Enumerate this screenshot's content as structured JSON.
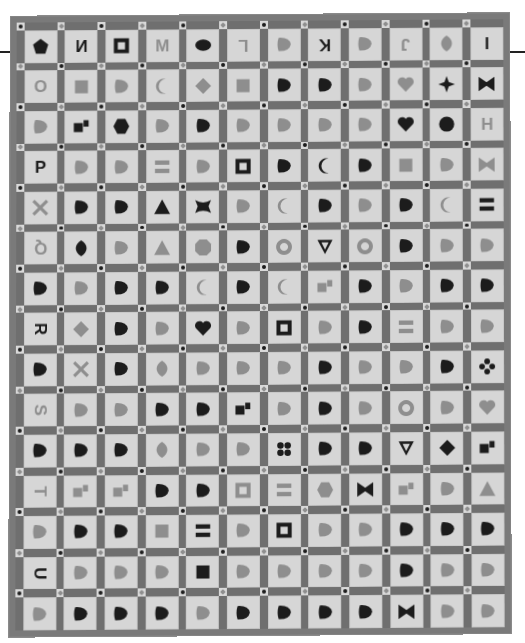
{
  "image": {
    "subject": "Appliqué alphabet sampler quilt",
    "grid": {
      "columns": 12,
      "rows": 15
    },
    "date_block": "1871",
    "palette": {
      "background": "#ffffff",
      "sashing": "#6f6f6f",
      "block": "#d6d6d6",
      "dark": "#1c1c1c",
      "mid": "#8e8e8e",
      "light_shape": "#a8a8a8"
    }
  },
  "rows": [
    [
      {
        "t": "shape",
        "s": "pentagon",
        "c": "dark"
      },
      {
        "t": "letter",
        "v": "N",
        "c": "dark",
        "f": "mirror"
      },
      {
        "t": "shape",
        "s": "square-frame",
        "c": "dark"
      },
      {
        "t": "letter",
        "v": "M",
        "c": "mid",
        "f": "mirror"
      },
      {
        "t": "shape",
        "s": "oval",
        "c": "dark"
      },
      {
        "t": "letter",
        "v": "L",
        "c": "mid",
        "f": "rot180"
      },
      {
        "t": "shape",
        "s": "star-cross",
        "c": "mid"
      },
      {
        "t": "letter",
        "v": "K",
        "c": "dark",
        "f": "rot180"
      },
      {
        "t": "shape",
        "s": "wing",
        "c": "mid"
      },
      {
        "t": "letter",
        "v": "J",
        "c": "mid",
        "f": "rot180"
      },
      {
        "t": "shape",
        "s": "leaf",
        "c": "mid"
      },
      {
        "t": "letter",
        "v": "I",
        "c": "dark"
      }
    ],
    [
      {
        "t": "letter",
        "v": "O",
        "c": "mid"
      },
      {
        "t": "shape",
        "s": "square",
        "c": "mid"
      },
      {
        "t": "shape",
        "s": "leaves",
        "c": "mid"
      },
      {
        "t": "shape",
        "s": "crescent",
        "c": "mid"
      },
      {
        "t": "shape",
        "s": "diamond",
        "c": "mid"
      },
      {
        "t": "shape",
        "s": "square",
        "c": "mid"
      },
      {
        "t": "shape",
        "s": "wedge",
        "c": "dark"
      },
      {
        "t": "shape",
        "s": "z-block",
        "c": "dark"
      },
      {
        "t": "shape",
        "s": "basket",
        "c": "mid"
      },
      {
        "t": "shape",
        "s": "heart",
        "c": "mid"
      },
      {
        "t": "shape",
        "s": "four-point-star",
        "c": "dark"
      },
      {
        "t": "shape",
        "s": "bowtie",
        "c": "dark"
      }
    ],
    [
      {
        "t": "shape",
        "s": "pinwheel",
        "c": "mid"
      },
      {
        "t": "shape",
        "s": "squares",
        "c": "dark"
      },
      {
        "t": "shape",
        "s": "hexagon",
        "c": "dark"
      },
      {
        "t": "shape",
        "s": "scissors",
        "c": "mid"
      },
      {
        "t": "shape",
        "s": "spool",
        "c": "dark"
      },
      {
        "t": "shape",
        "s": "bar",
        "c": "mid"
      },
      {
        "t": "shape",
        "s": "cross",
        "c": "mid"
      },
      {
        "t": "shape",
        "s": "fan",
        "c": "mid"
      },
      {
        "t": "shape",
        "s": "bowl",
        "c": "mid"
      },
      {
        "t": "shape",
        "s": "heart",
        "c": "dark"
      },
      {
        "t": "shape",
        "s": "circle-split",
        "c": "dark"
      },
      {
        "t": "letter",
        "v": "H",
        "c": "mid"
      }
    ],
    [
      {
        "t": "letter",
        "v": "P",
        "c": "dark"
      },
      {
        "t": "shape",
        "s": "arc",
        "c": "mid"
      },
      {
        "t": "shape",
        "s": "arc",
        "c": "mid"
      },
      {
        "t": "shape",
        "s": "bars",
        "c": "mid"
      },
      {
        "t": "shape",
        "s": "fan",
        "c": "mid"
      },
      {
        "t": "shape",
        "s": "square-frame",
        "c": "dark"
      },
      {
        "t": "shape",
        "s": "boot",
        "c": "dark"
      },
      {
        "t": "shape",
        "s": "crescent",
        "c": "dark"
      },
      {
        "t": "shape",
        "s": "domino",
        "c": "dark"
      },
      {
        "t": "shape",
        "s": "square",
        "c": "mid"
      },
      {
        "t": "shape",
        "s": "angle",
        "c": "mid"
      },
      {
        "t": "shape",
        "s": "bowtie",
        "c": "mid"
      }
    ],
    [
      {
        "t": "shape",
        "s": "x-cross",
        "c": "mid"
      },
      {
        "t": "shape",
        "s": "split-circle",
        "c": "dark"
      },
      {
        "t": "shape",
        "s": "patchwork",
        "c": "dark"
      },
      {
        "t": "shape",
        "s": "triangle",
        "c": "dark"
      },
      {
        "t": "shape",
        "s": "butterfly",
        "c": "dark"
      },
      {
        "t": "shape",
        "s": "half-circles",
        "c": "mid"
      },
      {
        "t": "shape",
        "s": "crescent",
        "c": "mid"
      },
      {
        "t": "shape",
        "s": "patchwork",
        "c": "dark"
      },
      {
        "t": "shape",
        "s": "leaf-pair",
        "c": "mid"
      },
      {
        "t": "shape",
        "s": "u-shape",
        "c": "dark"
      },
      {
        "t": "shape",
        "s": "crescent",
        "c": "mid"
      },
      {
        "t": "shape",
        "s": "bars",
        "c": "dark"
      }
    ],
    [
      {
        "t": "letter",
        "v": "Q",
        "c": "mid",
        "f": "rot180"
      },
      {
        "t": "shape",
        "s": "leaf",
        "c": "dark"
      },
      {
        "t": "shape",
        "s": "axe",
        "c": "mid"
      },
      {
        "t": "shape",
        "s": "triangle",
        "c": "mid"
      },
      {
        "t": "shape",
        "s": "octagon",
        "c": "mid"
      },
      {
        "t": "shape",
        "s": "leaves",
        "c": "dark"
      },
      {
        "t": "shape",
        "s": "ring",
        "c": "mid"
      },
      {
        "t": "shape",
        "s": "triangle-frame",
        "c": "dark"
      },
      {
        "t": "shape",
        "s": "ring",
        "c": "mid"
      },
      {
        "t": "shape",
        "s": "patchwork",
        "c": "dark"
      },
      {
        "t": "shape",
        "s": "flower",
        "c": "mid"
      },
      {
        "t": "shape",
        "s": "leaf-pair",
        "c": "mid"
      },
      {
        "t": "letter",
        "v": "F",
        "c": "dark",
        "f": "rot90"
      }
    ],
    [
      {
        "t": "shape",
        "s": "wedge-dot",
        "c": "dark"
      },
      {
        "t": "shape",
        "s": "leaves",
        "c": "mid"
      },
      {
        "t": "shape",
        "s": "horseshoe",
        "c": "dark"
      },
      {
        "t": "shape",
        "s": "trees",
        "c": "dark"
      },
      {
        "t": "shape",
        "s": "crescent",
        "c": "mid"
      },
      {
        "t": "shape",
        "s": "square-boot",
        "c": "dark"
      },
      {
        "t": "shape",
        "s": "crescent",
        "c": "mid"
      },
      {
        "t": "shape",
        "s": "squares",
        "c": "mid"
      },
      {
        "t": "shape",
        "s": "boot",
        "c": "dark"
      },
      {
        "t": "shape",
        "s": "shell",
        "c": "mid"
      },
      {
        "t": "shape",
        "s": "horseshoe",
        "c": "dark"
      },
      {
        "t": "shape",
        "s": "boot",
        "c": "dark"
      },
      {
        "t": "shape",
        "s": "heart-leaf",
        "c": "dark"
      }
    ],
    [
      {
        "t": "letter",
        "v": "R",
        "c": "dark",
        "f": "rot90"
      },
      {
        "t": "shape",
        "s": "diamond",
        "c": "mid"
      },
      {
        "t": "shape",
        "s": "cup",
        "c": "dark"
      },
      {
        "t": "shape",
        "s": "cup",
        "c": "mid"
      },
      {
        "t": "shape",
        "s": "heart",
        "c": "dark"
      },
      {
        "t": "shape",
        "s": "leaves",
        "c": "mid"
      },
      {
        "t": "shape",
        "s": "square-frame",
        "c": "dark"
      },
      {
        "t": "shape",
        "s": "square-cross",
        "c": "mid"
      },
      {
        "t": "shape",
        "s": "heart-dot",
        "c": "dark"
      },
      {
        "t": "shape",
        "s": "bars",
        "c": "mid"
      },
      {
        "t": "shape",
        "s": "infinity",
        "c": "mid"
      },
      {
        "t": "shape",
        "s": "blob",
        "c": "mid"
      },
      {
        "t": "letter",
        "v": "E",
        "c": "mid",
        "f": "rot90"
      }
    ],
    [
      {
        "t": "shape",
        "s": "heart-dot",
        "c": "dark"
      },
      {
        "t": "shape",
        "s": "x-cross",
        "c": "mid"
      },
      {
        "t": "shape",
        "s": "bird",
        "c": "dark"
      },
      {
        "t": "shape",
        "s": "leaf",
        "c": "mid"
      },
      {
        "t": "shape",
        "s": "boot",
        "c": "mid"
      },
      {
        "t": "shape",
        "s": "leaf-pair",
        "c": "mid"
      },
      {
        "t": "shape",
        "s": "cluster",
        "c": "mid"
      },
      {
        "t": "shape",
        "s": "bell",
        "c": "dark"
      },
      {
        "t": "shape",
        "s": "curl",
        "c": "mid"
      },
      {
        "t": "shape",
        "s": "half-circles",
        "c": "mid"
      },
      {
        "t": "shape",
        "s": "star",
        "c": "dark"
      },
      {
        "t": "shape",
        "s": "four-petal",
        "c": "dark"
      },
      {
        "t": "shape",
        "s": "fish",
        "c": "mid"
      }
    ],
    [
      {
        "t": "letter",
        "v": "S",
        "c": "mid",
        "f": "rot90"
      },
      {
        "t": "shape",
        "s": "circle-angle",
        "c": "mid"
      },
      {
        "t": "shape",
        "s": "arc-diamond",
        "c": "mid"
      },
      {
        "t": "shape",
        "s": "speech",
        "c": "dark"
      },
      {
        "t": "shape",
        "s": "leaf-stem",
        "c": "dark"
      },
      {
        "t": "shape",
        "s": "squares",
        "c": "dark"
      },
      {
        "t": "shape",
        "s": "hat",
        "c": "mid"
      },
      {
        "t": "shape",
        "s": "square-dots",
        "c": "dark"
      },
      {
        "t": "shape",
        "s": "arc",
        "c": "mid"
      },
      {
        "t": "shape",
        "s": "ring",
        "c": "mid"
      },
      {
        "t": "shape",
        "s": "bag",
        "c": "mid"
      },
      {
        "t": "shape",
        "s": "heart",
        "c": "mid"
      },
      {
        "t": "letter",
        "v": "D",
        "c": "dark",
        "f": "rot90"
      }
    ],
    [
      {
        "t": "shape",
        "s": "chevrons",
        "c": "dark"
      },
      {
        "t": "shape",
        "s": "domino",
        "c": "dark"
      },
      {
        "t": "shape",
        "s": "maple-leaf",
        "c": "dark"
      },
      {
        "t": "shape",
        "s": "leaf",
        "c": "mid"
      },
      {
        "t": "shape",
        "s": "triangles",
        "c": "mid"
      },
      {
        "t": "shape",
        "s": "square-x",
        "c": "mid"
      },
      {
        "t": "shape",
        "s": "four-dots",
        "c": "dark"
      },
      {
        "t": "shape",
        "s": "patchwork",
        "c": "dark"
      },
      {
        "t": "shape",
        "s": "ladder-circle",
        "c": "dark"
      },
      {
        "t": "shape",
        "s": "triangle-frame",
        "c": "dark"
      },
      {
        "t": "shape",
        "s": "diamond",
        "c": "dark"
      },
      {
        "t": "shape",
        "s": "squares",
        "c": "dark"
      },
      {
        "t": "shape",
        "s": "rounded-rect",
        "c": "dark"
      }
    ],
    [
      {
        "t": "letter",
        "v": "T",
        "c": "mid",
        "f": "rot90"
      },
      {
        "t": "shape",
        "s": "squares",
        "c": "mid"
      },
      {
        "t": "shape",
        "s": "squares",
        "c": "mid"
      },
      {
        "t": "shape",
        "s": "grapes",
        "c": "dark"
      },
      {
        "t": "shape",
        "s": "leaf-frame",
        "c": "dark"
      },
      {
        "t": "shape",
        "s": "square-frame",
        "c": "mid"
      },
      {
        "t": "shape",
        "s": "bars",
        "c": "mid"
      },
      {
        "t": "shape",
        "s": "hexagon",
        "c": "mid"
      },
      {
        "t": "shape",
        "s": "bowtie",
        "c": "dark"
      },
      {
        "t": "shape",
        "s": "squares",
        "c": "mid"
      },
      {
        "t": "shape",
        "s": "rects",
        "c": "mid"
      },
      {
        "t": "shape",
        "s": "triangle",
        "c": "mid"
      },
      {
        "t": "letter",
        "v": "C",
        "c": "mid",
        "f": "rot90"
      }
    ],
    [
      {
        "t": "shape",
        "s": "apple",
        "c": "mid"
      },
      {
        "t": "shape",
        "s": "anchor",
        "c": "dark"
      },
      {
        "t": "shape",
        "s": "triangle-square",
        "c": "dark"
      },
      {
        "t": "shape",
        "s": "square",
        "c": "mid"
      },
      {
        "t": "shape",
        "s": "bars",
        "c": "dark"
      },
      {
        "t": "shape",
        "s": "hourglass",
        "c": "mid"
      },
      {
        "t": "shape",
        "s": "square-frame",
        "c": "dark"
      },
      {
        "t": "shape",
        "s": "wing",
        "c": "mid"
      },
      {
        "t": "shape",
        "s": "arc",
        "c": "mid"
      },
      {
        "t": "shape",
        "s": "berries",
        "c": "dark"
      },
      {
        "t": "shape",
        "s": "rects",
        "c": "dark"
      },
      {
        "t": "shape",
        "s": "patchwork",
        "c": "dark"
      },
      {
        "t": "shape",
        "s": "square",
        "c": "dark"
      }
    ],
    [
      {
        "t": "letter",
        "v": "U",
        "c": "dark",
        "f": "rot90"
      },
      {
        "t": "shape",
        "s": "funnel",
        "c": "mid"
      },
      {
        "t": "shape",
        "s": "apple",
        "c": "mid"
      },
      {
        "t": "shape",
        "s": "goblet",
        "c": "mid"
      },
      {
        "t": "shape",
        "s": "square",
        "c": "dark"
      },
      {
        "t": "shape",
        "s": "basket",
        "c": "mid"
      },
      {
        "t": "shape",
        "s": "cup",
        "c": "mid"
      },
      {
        "t": "shape",
        "s": "u-shape",
        "c": "mid"
      },
      {
        "t": "shape",
        "s": "cup",
        "c": "mid"
      },
      {
        "t": "shape",
        "s": "grapes",
        "c": "dark"
      },
      {
        "t": "shape",
        "s": "anvil",
        "c": "mid"
      },
      {
        "t": "shape",
        "s": "house",
        "c": "mid"
      },
      {
        "t": "letter",
        "v": "B",
        "c": "mid",
        "f": "rot90"
      }
    ],
    [
      {
        "t": "shape",
        "s": "halves",
        "c": "mid"
      },
      {
        "t": "shape",
        "s": "patchwork",
        "c": "dark"
      },
      {
        "t": "shape",
        "s": "boot",
        "c": "dark"
      },
      {
        "t": "shape",
        "s": "diamonds",
        "c": "dark"
      },
      {
        "t": "shape",
        "s": "triangle-square",
        "c": "mid"
      },
      {
        "t": "shape",
        "s": "blob",
        "c": "dark"
      },
      {
        "t": "shape",
        "s": "bird",
        "c": "dark"
      },
      {
        "t": "shape",
        "s": "patchwork",
        "c": "dark"
      },
      {
        "t": "shape",
        "s": "split-fan",
        "c": "dark"
      },
      {
        "t": "shape",
        "s": "bowtie",
        "c": "dark"
      },
      {
        "t": "shape",
        "s": "halves",
        "c": "mid"
      },
      {
        "t": "shape",
        "s": "bar-diamond",
        "c": "mid"
      },
      {
        "t": "shape",
        "s": "bag",
        "c": "dark"
      }
    ],
    [
      {
        "t": "letter",
        "v": "V",
        "c": "dark",
        "f": "rot90"
      },
      {
        "t": "shape",
        "s": "wedge-dot",
        "c": "mid"
      },
      {
        "t": "letter",
        "v": "W",
        "c": "mid"
      },
      {
        "t": "shape",
        "s": "leaf-pair",
        "c": "mid"
      },
      {
        "t": "letter",
        "v": "X",
        "c": "dark"
      },
      {
        "t": "shape",
        "s": "patchwork",
        "c": "dark"
      },
      {
        "t": "letter",
        "v": "Y",
        "c": "mid"
      },
      {
        "t": "shape",
        "s": "halves",
        "c": "mid"
      },
      {
        "t": "letter",
        "v": "Z",
        "c": "dark"
      },
      {
        "t": "shape",
        "s": "halves",
        "c": "mid"
      },
      {
        "t": "letter",
        "v": "&",
        "c": "dark"
      },
      {
        "t": "letter",
        "v": "1871",
        "c": "mid",
        "small": true
      },
      {
        "t": "letter",
        "v": "A",
        "c": "dark",
        "f": "rot90"
      }
    ]
  ]
}
